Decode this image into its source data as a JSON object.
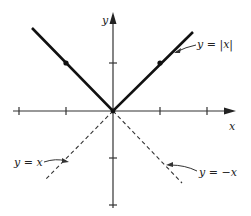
{
  "diagram": {
    "type": "function-graph",
    "axes": {
      "x_label": "x",
      "y_label": "y",
      "x_ticks": [
        -2,
        -1,
        1,
        2
      ],
      "y_ticks": [
        1,
        -1,
        -2
      ]
    },
    "curves": [
      {
        "label": "y = |x|",
        "style": "solid",
        "marked_points": [
          [
            -1,
            1
          ],
          [
            1,
            1
          ]
        ]
      },
      {
        "label": "y = x",
        "style": "dashed"
      },
      {
        "label": "y = −x",
        "style": "dashed"
      }
    ]
  },
  "labels": {
    "abs": "y = |x|",
    "identity": "y = x",
    "negative": "y = −x",
    "x_axis": "x",
    "y_axis": "y"
  }
}
